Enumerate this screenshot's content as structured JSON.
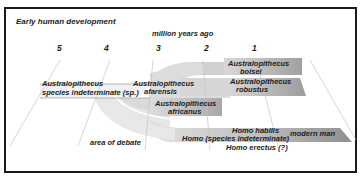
{
  "title": "Early human development",
  "axis_label": "million years ago",
  "ticks": [
    "5",
    "4",
    "3",
    "2",
    "1"
  ],
  "labels": {
    "sp_line1": "Australopithecus",
    "sp_line2": "species indeterminate (sp.)",
    "afarensis_line1": "Australopithecus",
    "afarensis_line2": "afarensis",
    "boisei_line1": "Australopithecus",
    "boisei_line2": "boisei",
    "robustus_line1": "Australopithecus",
    "robustus_line2": "robustus",
    "africanus_line1": "Australopithecus",
    "africanus_line2": "africanus",
    "habilis": "Homo habilis",
    "homo_sp": "Homo (species indeterminate)",
    "erectus": "Homo erectus (?)",
    "modern": "modern man",
    "debate": "area of debate"
  },
  "colors": {
    "band_light": "#e4e4e4",
    "band_mid": "#cfcfcf",
    "band_dark": "#a9a9a9",
    "frame": "#1a1a1a",
    "guide_line": "#bdbdbd"
  }
}
